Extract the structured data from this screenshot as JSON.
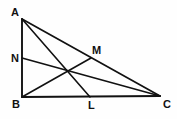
{
  "figure": {
    "background_color": "#fefefe",
    "stroke_color": "#111111",
    "stroke_width": 1.6,
    "width": 177,
    "height": 119
  },
  "points": {
    "A": {
      "label": "A",
      "x": 22,
      "y": 19,
      "label_x": 11,
      "label_y": 7
    },
    "B": {
      "label": "B",
      "x": 22,
      "y": 97,
      "label_x": 12,
      "label_y": 99
    },
    "C": {
      "label": "C",
      "x": 160,
      "y": 96,
      "label_x": 163,
      "label_y": 99
    },
    "N": {
      "label": "N",
      "x": 22,
      "y": 58,
      "label_x": 11,
      "label_y": 53
    },
    "M": {
      "label": "M",
      "x": 91,
      "y": 58,
      "label_x": 92,
      "label_y": 45
    },
    "L": {
      "label": "L",
      "x": 90,
      "y": 97,
      "label_x": 88,
      "label_y": 100
    }
  },
  "segments": [
    {
      "name": "side-AB",
      "from": "A",
      "to": "B"
    },
    {
      "name": "side-BC",
      "from": "B",
      "to": "C"
    },
    {
      "name": "side-AC",
      "from": "A",
      "to": "C"
    },
    {
      "name": "cevian-AL",
      "from": "A",
      "to": "L"
    },
    {
      "name": "cevian-BM",
      "from": "B",
      "to": "M"
    },
    {
      "name": "cevian-NC",
      "from": "N",
      "to": "C"
    }
  ],
  "geometry_paths": {
    "side_AB": "M 22 19 L 22 97",
    "side_BC": "M 22 97 L 160 96",
    "side_AC": "M 22 19 L 160 96",
    "cevian_AL": "M 22 19 L 90 97",
    "cevian_BM": "M 22 97 L 91 58",
    "cevian_NC": "M 22 58 L 160 96"
  }
}
